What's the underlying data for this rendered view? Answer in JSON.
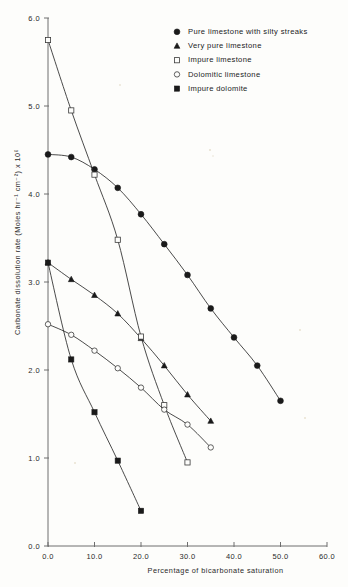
{
  "figure": {
    "background": "#fdfdfb",
    "ink": "#1b1b1b"
  },
  "axes": {
    "y": {
      "title": "Carbonate dissolution rate  (Moles hr⁻¹ cm⁻²) x 10⁶",
      "ticks": [
        "0.0",
        "1.0",
        "2.0",
        "3.0",
        "4.0",
        "5.0",
        "6.0"
      ],
      "tick_values": [
        0.0,
        1.0,
        2.0,
        3.0,
        4.0,
        5.0,
        6.0
      ],
      "range": [
        0.0,
        6.0
      ]
    },
    "x": {
      "title": "Percentage of bicarbonate saturation",
      "ticks": [
        "0.0",
        "10.0",
        "20.0",
        "30.0",
        "40.0",
        "50.0",
        "60.0"
      ],
      "tick_values": [
        0,
        100,
        200,
        300,
        400,
        500,
        600
      ],
      "range": [
        0,
        600
      ]
    }
  },
  "legend": {
    "position": "top-right-inside",
    "items": [
      {
        "label": "Pure limestone with silty streaks",
        "marker": "filled-circle"
      },
      {
        "label": "Very pure limestone",
        "marker": "filled-triangle"
      },
      {
        "label": "Impure  limestone",
        "marker": "open-square"
      },
      {
        "label": "Dolomitic  limestone",
        "marker": "open-circle"
      },
      {
        "label": "Impure  dolomite",
        "marker": "filled-square"
      }
    ]
  },
  "chart_data": {
    "type": "line",
    "title": "",
    "subtitle": "",
    "xlabel": "Percentage of bicarbonate saturation",
    "ylabel": "Carbonate dissolution rate  (Moles hr⁻¹ cm⁻²) x 10⁶",
    "xlim": [
      0,
      600
    ],
    "ylim": [
      0.0,
      6.0
    ],
    "xticks": [
      0,
      100,
      200,
      300,
      400,
      500,
      600
    ],
    "xticklabels": [
      "0.0",
      "10.0",
      "20.0",
      "30.0",
      "40.0",
      "50.0",
      "60.0"
    ],
    "yticks": [
      0.0,
      1.0,
      2.0,
      3.0,
      4.0,
      5.0,
      6.0
    ],
    "yticklabels": [
      "0.0",
      "1.0",
      "2.0",
      "3.0",
      "4.0",
      "5.0",
      "6.0"
    ],
    "grid": false,
    "legend_position": "upper right",
    "series": [
      {
        "name": "Pure limestone with silty streaks",
        "marker": "filled-circle",
        "x": [
          0,
          50,
          100,
          150,
          200,
          250,
          300,
          350,
          400,
          450,
          500
        ],
        "y": [
          4.45,
          4.42,
          4.28,
          4.07,
          3.77,
          3.43,
          3.08,
          2.7,
          2.37,
          2.05,
          1.65
        ]
      },
      {
        "name": "Very pure limestone",
        "marker": "filled-triangle",
        "x": [
          0,
          50,
          100,
          150,
          200,
          250,
          300,
          350
        ],
        "y": [
          3.22,
          3.03,
          2.85,
          2.64,
          2.36,
          2.05,
          1.72,
          1.42
        ]
      },
      {
        "name": "Impure  limestone",
        "marker": "open-square",
        "x": [
          0,
          50,
          100,
          150,
          200,
          250,
          300
        ],
        "y": [
          5.75,
          4.95,
          4.22,
          3.48,
          2.38,
          1.6,
          0.95
        ]
      },
      {
        "name": "Dolomitic  limestone",
        "marker": "open-circle",
        "x": [
          0,
          50,
          100,
          150,
          200,
          250,
          300,
          350
        ],
        "y": [
          2.52,
          2.4,
          2.22,
          2.02,
          1.8,
          1.55,
          1.38,
          1.12
        ]
      },
      {
        "name": "Impure  dolomite",
        "marker": "filled-square",
        "x": [
          0,
          50,
          100,
          150,
          200
        ],
        "y": [
          3.22,
          2.12,
          1.52,
          0.97,
          0.4
        ]
      }
    ]
  }
}
